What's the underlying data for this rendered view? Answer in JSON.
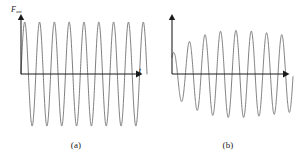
{
  "figure": {
    "background": "#ffffff",
    "curve_color": "#6f6f6f",
    "axis_color": "#1a1a1a",
    "panels": [
      {
        "id": "a",
        "caption": "(a)",
        "y_axis_label": "F",
        "y_axis_sublabel": "ext",
        "x_axis_label": "t"
      },
      {
        "id": "b",
        "caption": "(b)",
        "y_axis_label": "y",
        "y_axis_sublabel": "",
        "x_axis_label": "t"
      }
    ]
  },
  "chart_data": [
    {
      "type": "line",
      "title": "",
      "subtitle": "",
      "xlabel": "t",
      "ylabel": "F_ext",
      "legend": [],
      "grid": false,
      "axes": {
        "x_arrow": true,
        "y_arrow": true,
        "x_ticks": [],
        "y_ticks": [],
        "xlim": [
          0,
          1
        ],
        "ylim": [
          -1.15,
          1.15
        ]
      },
      "description": "Sinusoidal driving force of constant amplitude versus time",
      "series": [
        {
          "name": "F_ext",
          "waveform": "sine",
          "amplitude": 1.0,
          "cycles": 8.5,
          "decay": 0.0,
          "phase_deg": 0,
          "envelope": "constant"
        }
      ]
    },
    {
      "type": "line",
      "title": "",
      "subtitle": "",
      "xlabel": "t",
      "ylabel": "y",
      "legend": [],
      "grid": false,
      "axes": {
        "x_arrow": true,
        "y_arrow": true,
        "x_ticks": [],
        "y_ticks": [],
        "xlim": [
          0,
          1
        ],
        "ylim": [
          -1.45,
          1.45
        ]
      },
      "description": "Displacement response showing large transient oscillations decaying to a smaller steady-state amplitude",
      "series": [
        {
          "name": "y",
          "waveform": "transient-plus-steady-state",
          "steady_amplitude": 0.72,
          "transient_amplitude": 1.35,
          "cycles": 8.0,
          "decay": 2.2,
          "phase_deg": 0,
          "envelope": "decaying"
        }
      ]
    }
  ]
}
